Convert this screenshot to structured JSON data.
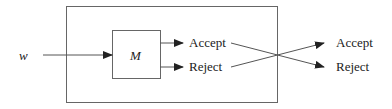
{
  "diagram": {
    "input_label": "w",
    "machine_label": "M",
    "inner_outputs": {
      "accept": "Accept",
      "reject": "Reject"
    },
    "outer_outputs": {
      "accept": "Accept",
      "reject": "Reject"
    },
    "colors": {
      "stroke": "#555555",
      "text": "#222222"
    }
  }
}
